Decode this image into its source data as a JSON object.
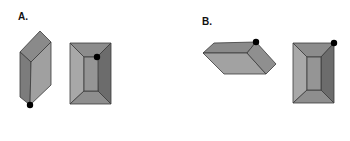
{
  "figure": {
    "panels": [
      {
        "label": "A.",
        "shapes": [
          "tilted-prism-with-bottom-vertex-marked",
          "rectangular-frustum-top-view-with-inner-corner-marked"
        ]
      },
      {
        "label": "B.",
        "shapes": [
          "horizontal-prism-with-top-right-vertex-marked",
          "rectangular-frustum-top-view-with-outer-corner-marked"
        ]
      }
    ],
    "colors": {
      "face_light": "#a3a3a3",
      "face_mid": "#8e8e8e",
      "face_dark": "#6f6f6f",
      "edge": "#3a3a3a",
      "marker": "#000000"
    }
  }
}
